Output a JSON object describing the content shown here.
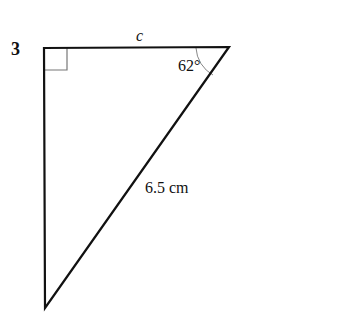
{
  "question": {
    "number": "3"
  },
  "triangle": {
    "side_top_label": "c",
    "angle_label": "62°",
    "hypotenuse_label": "6.5 cm",
    "right_angle_marker": true
  }
}
